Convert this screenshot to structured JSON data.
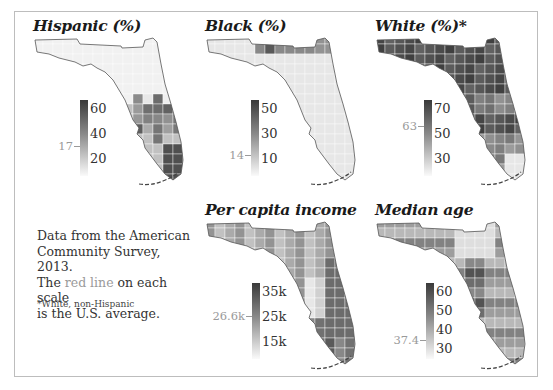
{
  "note": {
    "line1": "Data from the American",
    "line2": "Community Survey, 2013.",
    "line3_pre": "The ",
    "line3_red": "red line",
    "line3_post": " on each scale",
    "line4": "is the U.S. average.",
    "footnote": "*White, non-Hispanic"
  },
  "panels": [
    {
      "title": "Hispanic (%)",
      "ticks": [
        "60",
        "40",
        "20"
      ],
      "avg_label": "17",
      "low": "#fafafa",
      "high": "#3a3a3a"
    },
    {
      "title": "Black (%)",
      "ticks": [
        "50",
        "30",
        "10"
      ],
      "avg_label": "14",
      "low": "#fafafa",
      "high": "#3a3a3a"
    },
    {
      "title": "White (%)*",
      "ticks": [
        "70",
        "50",
        "30"
      ],
      "avg_label": "63",
      "low": "#fafafa",
      "high": "#3a3a3a"
    },
    {
      "title": "Per capita income",
      "ticks": [
        "35k",
        "25k",
        "15k"
      ],
      "avg_label": "26.6k",
      "low": "#fafafa",
      "high": "#3a3a3a"
    },
    {
      "title": "Median age",
      "ticks": [
        "60",
        "50",
        "40",
        "30"
      ],
      "avg_label": "37.4",
      "low": "#fafafa",
      "high": "#3a3a3a"
    }
  ],
  "chart_data": [
    {
      "type": "heatmap",
      "title": "Hispanic (%)",
      "region": "Florida counties",
      "scale": {
        "min": 10,
        "max": 65,
        "ticks": [
          20,
          40,
          60
        ]
      },
      "us_average": 17,
      "pattern": "light in north/panhandle; darker in south-central and Miami-Dade (~65%)"
    },
    {
      "type": "heatmap",
      "title": "Black (%)",
      "region": "Florida counties",
      "scale": {
        "min": 5,
        "max": 55,
        "ticks": [
          10,
          30,
          50
        ]
      },
      "us_average": 14,
      "pattern": "darker along north-central border (Gadsden ~55%); light in peninsula"
    },
    {
      "type": "heatmap",
      "title": "White (%)*",
      "region": "Florida counties",
      "scale": {
        "min": 20,
        "max": 85,
        "ticks": [
          30,
          50,
          70
        ]
      },
      "us_average": 63,
      "pattern": "dark across north; lighter in south Florida (Miami-Dade ~15%)"
    },
    {
      "type": "heatmap",
      "title": "Per capita income",
      "region": "Florida counties",
      "scale": {
        "min": 13000,
        "max": 38000,
        "ticks": [
          "15k",
          "25k",
          "35k"
        ]
      },
      "us_average": "26.6k",
      "pattern": "darker on southwest/southeast coasts; lighter in interior"
    },
    {
      "type": "heatmap",
      "title": "Median age",
      "region": "Florida counties",
      "scale": {
        "min": 28,
        "max": 65,
        "ticks": [
          30,
          40,
          50,
          60
        ]
      },
      "us_average": 37.4,
      "pattern": "darker on Gulf coast (Sumter ~65); lighter in north-central"
    }
  ]
}
